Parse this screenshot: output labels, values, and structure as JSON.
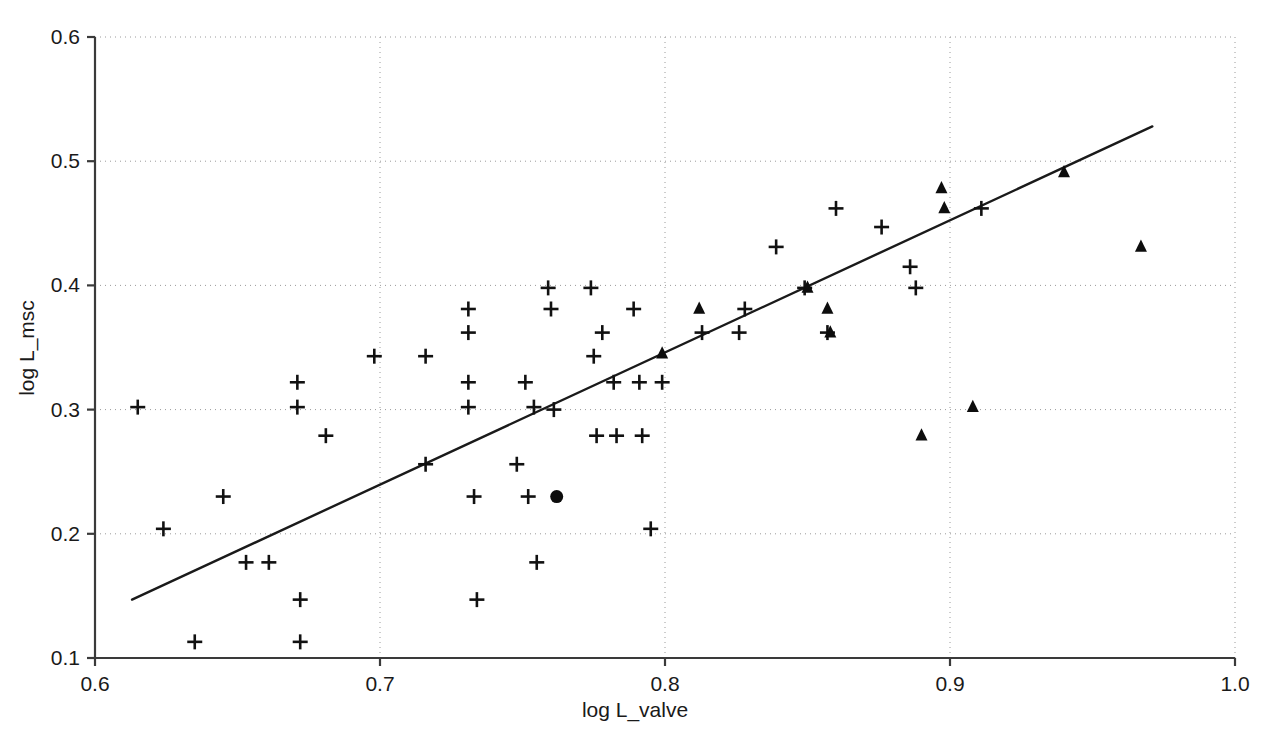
{
  "chart_data": {
    "type": "scatter",
    "title": "",
    "subtitle": "",
    "xlabel": "log L_valve",
    "ylabel": "log L_msc",
    "xlim": [
      0.6,
      1.0
    ],
    "ylim": [
      0.1,
      0.6
    ],
    "xticks": [
      0.6,
      0.7,
      0.8,
      0.9,
      1.0
    ],
    "xticklabels": [
      "0.6",
      "0.7",
      "0.8",
      "0.9",
      "1.0"
    ],
    "yticks": [
      0.1,
      0.2,
      0.3,
      0.4,
      0.5,
      0.6
    ],
    "yticklabels": [
      "0.1",
      "0.2",
      "0.3",
      "0.4",
      "0.5",
      "0.6"
    ],
    "grid": true,
    "grid_style": "dotted",
    "legend": null,
    "legend_position": "none",
    "annotations": [],
    "marker_colors": {
      "cross": "#111111",
      "triangle": "#0d0d0d",
      "circle": "#0d0d0d",
      "fit_line": "#1a1a1a",
      "grid": "#9a9a9a",
      "axis": "#3a3a3a",
      "background": "#ffffff"
    },
    "series": [
      {
        "name": "cross",
        "marker": "plus",
        "points": [
          [
            0.615,
            0.302
          ],
          [
            0.624,
            0.204
          ],
          [
            0.635,
            0.113
          ],
          [
            0.645,
            0.23
          ],
          [
            0.653,
            0.177
          ],
          [
            0.661,
            0.177
          ],
          [
            0.671,
            0.322
          ],
          [
            0.671,
            0.302
          ],
          [
            0.672,
            0.147
          ],
          [
            0.672,
            0.113
          ],
          [
            0.681,
            0.279
          ],
          [
            0.698,
            0.343
          ],
          [
            0.716,
            0.343
          ],
          [
            0.716,
            0.256
          ],
          [
            0.731,
            0.381
          ],
          [
            0.731,
            0.362
          ],
          [
            0.731,
            0.322
          ],
          [
            0.731,
            0.302
          ],
          [
            0.733,
            0.23
          ],
          [
            0.734,
            0.147
          ],
          [
            0.748,
            0.256
          ],
          [
            0.751,
            0.322
          ],
          [
            0.752,
            0.23
          ],
          [
            0.754,
            0.302
          ],
          [
            0.755,
            0.177
          ],
          [
            0.759,
            0.398
          ],
          [
            0.76,
            0.381
          ],
          [
            0.761,
            0.3
          ],
          [
            0.774,
            0.398
          ],
          [
            0.775,
            0.343
          ],
          [
            0.776,
            0.279
          ],
          [
            0.778,
            0.362
          ],
          [
            0.782,
            0.322
          ],
          [
            0.783,
            0.279
          ],
          [
            0.789,
            0.381
          ],
          [
            0.791,
            0.322
          ],
          [
            0.792,
            0.279
          ],
          [
            0.795,
            0.204
          ],
          [
            0.799,
            0.322
          ],
          [
            0.813,
            0.362
          ],
          [
            0.826,
            0.362
          ],
          [
            0.828,
            0.381
          ],
          [
            0.839,
            0.431
          ],
          [
            0.849,
            0.398
          ],
          [
            0.857,
            0.362
          ],
          [
            0.86,
            0.462
          ],
          [
            0.876,
            0.447
          ],
          [
            0.886,
            0.415
          ],
          [
            0.888,
            0.398
          ],
          [
            0.911,
            0.462
          ]
        ]
      },
      {
        "name": "triangle",
        "marker": "triangle",
        "points": [
          [
            0.799,
            0.345
          ],
          [
            0.812,
            0.381
          ],
          [
            0.85,
            0.398
          ],
          [
            0.857,
            0.381
          ],
          [
            0.858,
            0.362
          ],
          [
            0.89,
            0.279
          ],
          [
            0.897,
            0.478
          ],
          [
            0.898,
            0.462
          ],
          [
            0.908,
            0.302
          ],
          [
            0.94,
            0.491
          ],
          [
            0.967,
            0.431
          ]
        ]
      },
      {
        "name": "circle",
        "marker": "circle",
        "points": [
          [
            0.762,
            0.23
          ]
        ]
      }
    ],
    "fit_line": {
      "type": "line",
      "x": [
        0.613,
        0.971
      ],
      "y": [
        0.147,
        0.528
      ]
    }
  }
}
